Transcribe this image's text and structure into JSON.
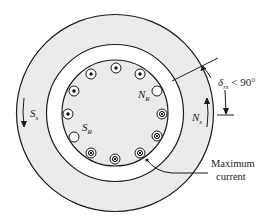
{
  "diagram": {
    "colors": {
      "stator_fill": "#ebebeb",
      "airgap_fill": "#ffffff",
      "rotor_fill": "#ebebeb",
      "stroke": "#1a1a1a"
    },
    "labels": {
      "stator_south": {
        "main": "S",
        "sub": "s"
      },
      "stator_north": {
        "main": "N",
        "sub": "s"
      },
      "rotor_north": {
        "main": "N",
        "sub": "R"
      },
      "rotor_south": {
        "main": "S",
        "sub": "R"
      },
      "angle": {
        "symbol": "δ",
        "sub": "rs",
        "rest": " < 90°"
      },
      "max_current_line1": "Maximum",
      "max_current_line2": "current"
    },
    "conductors": [
      {
        "position": "top",
        "type": "dot"
      },
      {
        "position": "top-left",
        "type": "dot"
      },
      {
        "position": "top-right",
        "type": "dot"
      },
      {
        "position": "left-upper",
        "type": "dot"
      },
      {
        "position": "left",
        "type": "dot"
      },
      {
        "position": "left-lower",
        "type": "empty"
      },
      {
        "position": "right-upper",
        "type": "empty"
      },
      {
        "position": "right",
        "type": "cross"
      },
      {
        "position": "right-lower",
        "type": "cross"
      },
      {
        "position": "bottom-right",
        "type": "cross"
      },
      {
        "position": "bottom",
        "type": "cross"
      },
      {
        "position": "bottom-left",
        "type": "cross"
      }
    ]
  }
}
